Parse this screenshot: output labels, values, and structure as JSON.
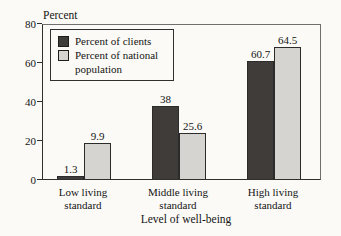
{
  "chart_data": {
    "type": "bar",
    "ylabel": "Percent",
    "xlabel": "Level of well-being",
    "categories": [
      "Low living standard",
      "Middle living standard",
      "High living standard"
    ],
    "series": [
      {
        "name": "Percent of clients",
        "values": [
          1.3,
          38,
          60.7
        ],
        "labels": [
          "1.3",
          "38",
          "60.7"
        ],
        "color": "#403c39"
      },
      {
        "name": "Percent of national population",
        "values": [
          9.9,
          25.6,
          64.5
        ],
        "labels": [
          "9.9",
          "25.6",
          "64.5"
        ],
        "color": "#d5d4d0"
      }
    ],
    "ylim": [
      0,
      80
    ],
    "yticks": [
      0,
      20,
      40,
      60,
      80
    ],
    "grid": false,
    "legend_position": "upper-left-inside",
    "layout": {
      "drawn_values": [
        [
          1.5,
          37.5,
          60.5
        ],
        [
          18.5,
          23.5,
          67.5
        ]
      ],
      "bar_width_px": 27,
      "bar_lefts_px": [
        [
          14,
          109,
          204
        ],
        [
          41,
          136,
          231
        ]
      ],
      "category_centers_px": [
        83,
        178,
        273
      ]
    }
  }
}
